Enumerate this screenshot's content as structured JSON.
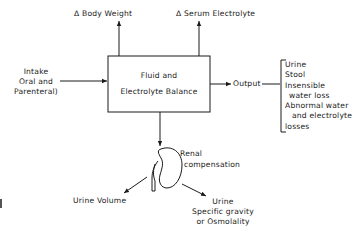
{
  "top_labels": {
    "body_weight": "Δ Body Weight",
    "serum_electrolyte": "Δ Serum Electrolyte"
  },
  "intake": {
    "lines": [
      "Intake",
      "Oral  and",
      "Parenteral)"
    ]
  },
  "center_box": {
    "line1": "Fluid   and",
    "line2": "Electrolyte   Balance"
  },
  "output": {
    "label": "Output",
    "items": [
      "Urine",
      "Stool",
      "Insensible",
      "water loss",
      "Abnormal water",
      "and electrolyte",
      "losses"
    ]
  },
  "renal": {
    "label_line1": "Renal",
    "label_line2": "compensation",
    "urine_volume": "Urine Volume",
    "urine_sg_lines": [
      "Urine",
      "Specific gravity",
      "or Osmolality"
    ]
  },
  "colors": {
    "ink": "#1a1a1a",
    "background": "#ffffff"
  }
}
